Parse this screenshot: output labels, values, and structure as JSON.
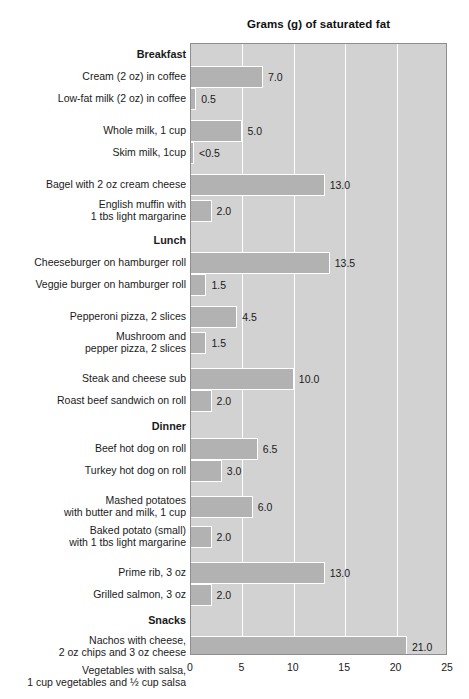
{
  "chart": {
    "title": "Grams (g) of saturated fat",
    "axis": {
      "xlabel": "",
      "ticks": [
        "0",
        "5",
        "10",
        "15",
        "20",
        "25"
      ]
    },
    "colors": {
      "bar_fill": "#b2b2b2",
      "bar_outline": "#ffffff",
      "plot_background": "#d2d2d2",
      "gridline": "#ffffff",
      "plot_border": "#8e8e8e",
      "text": "#1a1a1a"
    }
  },
  "chart_data": {
    "type": "bar",
    "orientation": "horizontal",
    "title": "Grams (g) of saturated fat",
    "xlabel": "Grams (g) of saturated fat",
    "ylabel": "",
    "xlim": [
      0,
      25
    ],
    "xticks": [
      0,
      5,
      10,
      15,
      20,
      25
    ],
    "grid": true,
    "legend": "none",
    "groups": [
      {
        "name": "Breakfast",
        "items": [
          {
            "label": "Cream (2 oz) in coffee",
            "value": 7.0,
            "value_label": "7.0"
          },
          {
            "label": "Low-fat milk (2 oz) in coffee",
            "value": 0.5,
            "value_label": "0.5"
          },
          {
            "label": "Whole milk, 1 cup",
            "value": 5.0,
            "value_label": "5.0"
          },
          {
            "label": "Skim milk, 1cup",
            "value": 0.3,
            "value_label": "<0.5"
          },
          {
            "label": "Bagel with 2 oz cream cheese",
            "value": 13.0,
            "value_label": "13.0"
          },
          {
            "label": "English muffin with\n1 tbs light margarine",
            "value": 2.0,
            "value_label": "2.0"
          }
        ]
      },
      {
        "name": "Lunch",
        "items": [
          {
            "label": "Cheeseburger on hamburger roll",
            "value": 13.5,
            "value_label": "13.5"
          },
          {
            "label": "Veggie burger on hamburger roll",
            "value": 1.5,
            "value_label": "1.5"
          },
          {
            "label": "Pepperoni pizza, 2 slices",
            "value": 4.5,
            "value_label": "4.5"
          },
          {
            "label": "Mushroom and\npepper pizza, 2 slices",
            "value": 1.5,
            "value_label": "1.5"
          },
          {
            "label": "Steak and cheese sub",
            "value": 10.0,
            "value_label": "10.0"
          },
          {
            "label": "Roast beef sandwich on roll",
            "value": 2.0,
            "value_label": "2.0"
          }
        ]
      },
      {
        "name": "Dinner",
        "items": [
          {
            "label": "Beef hot dog on roll",
            "value": 6.5,
            "value_label": "6.5"
          },
          {
            "label": "Turkey hot dog on roll",
            "value": 3.0,
            "value_label": "3.0"
          },
          {
            "label": "Mashed potatoes\nwith butter and milk, 1 cup",
            "value": 6.0,
            "value_label": "6.0"
          },
          {
            "label": "Baked potato (small)\nwith 1 tbs light margarine",
            "value": 2.0,
            "value_label": "2.0"
          },
          {
            "label": "Prime rib, 3 oz",
            "value": 13.0,
            "value_label": "13.0"
          },
          {
            "label": "Grilled salmon, 3 oz",
            "value": 2.0,
            "value_label": "2.0"
          }
        ]
      },
      {
        "name": "Snacks",
        "items": [
          {
            "label": "Nachos with cheese,\n2 oz chips and 3 oz cheese",
            "value": 21.0,
            "value_label": "21.0"
          },
          {
            "label": "Vegetables with salsa,\n1 cup vegetables and ½ cup salsa",
            "value": 0,
            "value_label": "0"
          },
          {
            "label": "Gourmet vanilla ice cream, 1 cup",
            "value": 21.0,
            "value_label": "21.0"
          },
          {
            "label": "Gourmet lemon sorbet, 1 cup",
            "value": 0,
            "value_label": "0"
          }
        ]
      }
    ]
  }
}
